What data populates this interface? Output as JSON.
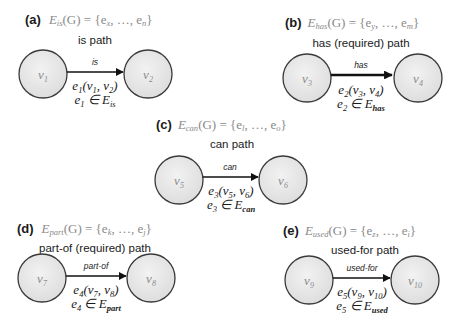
{
  "colors": {
    "node_fill": "#e8e8e8",
    "node_stroke": "#3a3a3a",
    "edge": "#111111",
    "formula_text": "#8a8a8a",
    "body_text": "#1a1a1a"
  },
  "panels": [
    {
      "letter": "(a)",
      "set_name": "E",
      "set_sub": "is",
      "formula_rest": "(G) = {e",
      "first_sub": "x",
      "ellipsis": ", …, e",
      "last_sub": "n",
      "close": "}",
      "description": "is path",
      "edge_label": "is",
      "source": {
        "name": "v",
        "sub": "1"
      },
      "target": {
        "name": "v",
        "sub": "2"
      },
      "edge_name": "e",
      "edge_sub": "1",
      "edge_args_open": "(v",
      "arg1_sub": "1",
      "arg_sep": ", v",
      "arg2_sub": "2",
      "edge_args_close": ")",
      "membership_op": " ∈ E",
      "membership_sub": "is"
    },
    {
      "letter": "(b)",
      "set_name": "E",
      "set_sub": "has",
      "formula_rest": "(G) = {e",
      "first_sub": "y",
      "ellipsis": ", …, e",
      "last_sub": "m",
      "close": "}",
      "description": "has (required) path",
      "edge_label": "has",
      "source": {
        "name": "v",
        "sub": "3"
      },
      "target": {
        "name": "v",
        "sub": "4"
      },
      "edge_name": "e",
      "edge_sub": "2",
      "edge_args_open": "(v",
      "arg1_sub": "3",
      "arg_sep": ", v",
      "arg2_sub": "4",
      "edge_args_close": ")",
      "membership_op": " ∈ E",
      "membership_sub": "has"
    },
    {
      "letter": "(c)",
      "set_name": "E",
      "set_sub": "can",
      "formula_rest": "(G) = {e",
      "first_sub": "l",
      "ellipsis": ", …, e",
      "last_sub": "o",
      "close": "}",
      "description": "can path",
      "edge_label": "can",
      "source": {
        "name": "v",
        "sub": "5"
      },
      "target": {
        "name": "v",
        "sub": "6"
      },
      "edge_name": "e",
      "edge_sub": "3",
      "edge_args_open": "(v",
      "arg1_sub": "5",
      "arg_sep": ", v",
      "arg2_sub": "6",
      "edge_args_close": ")",
      "membership_op": " ∈ E",
      "membership_sub": "can"
    },
    {
      "letter": "(d)",
      "set_name": "E",
      "set_sub": "part",
      "formula_rest": "(G) = {e",
      "first_sub": "k",
      "ellipsis": ", …, e",
      "last_sub": "j",
      "close": "}",
      "description": "part-of (required) path",
      "edge_label": "part-of",
      "source": {
        "name": "v",
        "sub": "7"
      },
      "target": {
        "name": "v",
        "sub": "8"
      },
      "edge_name": "e",
      "edge_sub": "4",
      "edge_args_open": "(v",
      "arg1_sub": "7",
      "arg_sep": ", v",
      "arg2_sub": "8",
      "edge_args_close": ")",
      "membership_op": " ∈ E",
      "membership_sub": "part"
    },
    {
      "letter": "(e)",
      "set_name": "E",
      "set_sub": "used",
      "formula_rest": "(G) = {e",
      "first_sub": "z",
      "ellipsis": ", …, e",
      "last_sub": "i",
      "close": "}",
      "description": "used-for path",
      "edge_label": "used-for",
      "source": {
        "name": "v",
        "sub": "9"
      },
      "target": {
        "name": "v",
        "sub": "10"
      },
      "edge_name": "e",
      "edge_sub": "5",
      "edge_args_open": "(v",
      "arg1_sub": "9",
      "arg_sep": ", v",
      "arg2_sub": "10",
      "edge_args_close": ")",
      "membership_op": " ∈ E",
      "membership_sub": "used"
    }
  ]
}
